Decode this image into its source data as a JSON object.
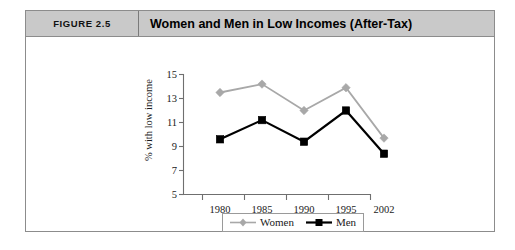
{
  "figure": {
    "number_label": "FIGURE 2.5",
    "title": "Women and Men in Low Incomes (After-Tax)"
  },
  "chart_data": {
    "type": "line",
    "title": "Women and Men in Low Incomes (After-Tax)",
    "xlabel": "",
    "ylabel": "% with low income",
    "categories": [
      "1980",
      "1985",
      "1990",
      "1995",
      "2002"
    ],
    "series": [
      {
        "name": "Women",
        "color": "#a8a8a8",
        "marker": "diamond",
        "values": [
          13.5,
          14.2,
          12.0,
          13.9,
          9.7
        ]
      },
      {
        "name": "Men",
        "color": "#000000",
        "marker": "square",
        "values": [
          9.6,
          11.2,
          9.4,
          12.0,
          8.4
        ]
      }
    ],
    "ylim": [
      5,
      15
    ],
    "yticks": [
      "15",
      "13",
      "11",
      "9",
      "7",
      "5"
    ],
    "ytick_values": [
      15,
      13,
      11,
      9,
      7,
      5
    ],
    "grid": false,
    "legend_position": "bottom"
  },
  "legend": {
    "entries": [
      {
        "label": "Women"
      },
      {
        "label": "Men"
      }
    ]
  },
  "colors": {
    "header_background": "#c9c9c9",
    "frame_border": "#8c8c8c",
    "women_series": "#a8a8a8",
    "men_series": "#000000",
    "axis": "#6f6f6f"
  }
}
